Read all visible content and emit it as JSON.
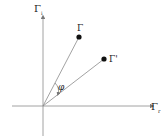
{
  "diagram": {
    "axes": {
      "vertical": {
        "label": "Γ",
        "subscript": "i"
      },
      "horizontal": {
        "label": "Γ",
        "subscript": "r"
      }
    },
    "points": [
      {
        "label": "Γ",
        "x": 79,
        "y": 37
      },
      {
        "label": "Γ'",
        "x": 104,
        "y": 59
      }
    ],
    "angle_label": "φ",
    "origin": {
      "x": 43,
      "y": 106
    },
    "colors": {
      "line": "#7a7a7a",
      "point": "#111111",
      "text": "#222222"
    }
  }
}
